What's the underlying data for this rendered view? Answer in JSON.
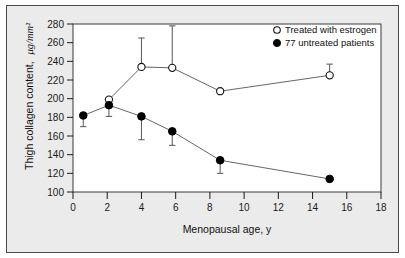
{
  "figure": {
    "background_color": "#ebebeb",
    "plot_background_color": "#ffffff",
    "frame_color": "#4a4a4a",
    "axis_color": "#000000"
  },
  "chart_data": {
    "type": "line",
    "title": "",
    "xlabel": "Menopausal age, y",
    "ylabel": "Thigh collagen content, μg/mm²",
    "ylabel_plain": "Thigh collagen content,",
    "ylabel_units": "μg/mm²",
    "xlim": [
      0,
      18
    ],
    "ylim": [
      100,
      280
    ],
    "xticks": [
      0,
      2,
      4,
      6,
      8,
      10,
      12,
      14,
      16,
      18
    ],
    "xtick_labels": [
      "0",
      "2",
      "4",
      "6",
      "8",
      "10",
      "12",
      "14",
      "16",
      "18"
    ],
    "yticks": [
      100,
      120,
      140,
      160,
      180,
      200,
      220,
      240,
      260,
      280
    ],
    "ytick_labels": [
      "100",
      "120",
      "140",
      "160",
      "180",
      "200",
      "220",
      "240",
      "260",
      "280"
    ],
    "grid": false,
    "legend_position": "top-right",
    "series": [
      {
        "name": "Treated with estrogen",
        "marker": "open-circle",
        "marker_fill": "#ffffff",
        "marker_edge": "#111111",
        "line_color": "#555555",
        "error_direction": "up",
        "x": [
          2.1,
          4.0,
          5.8,
          8.6,
          15.0
        ],
        "values": [
          199,
          234,
          233,
          208,
          225
        ],
        "error_upper": [
          0,
          31,
          45,
          0,
          12
        ]
      },
      {
        "name": "77 untreated patients",
        "marker": "filled-circle",
        "marker_fill": "#000000",
        "marker_edge": "#000000",
        "line_color": "#555555",
        "error_direction": "down",
        "x": [
          0.6,
          2.1,
          4.0,
          5.8,
          8.6,
          15.0
        ],
        "values": [
          182,
          193,
          181,
          165,
          134,
          114
        ],
        "error_lower": [
          12,
          12,
          25,
          15,
          14,
          0
        ]
      }
    ],
    "legend": [
      {
        "label": "Treated with estrogen",
        "marker": "open-circle"
      },
      {
        "label": "77 untreated patients",
        "marker": "filled-circle"
      }
    ]
  }
}
